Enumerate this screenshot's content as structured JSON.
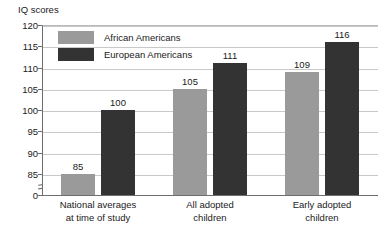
{
  "chart_data": {
    "type": "bar",
    "title": "",
    "ylabel": "IQ scores",
    "xlabel": "",
    "categories": [
      "National averages\nat time of study",
      "All adopted\nchildren",
      "Early adopted\nchildren"
    ],
    "category_lines": [
      [
        "National averages",
        "at time of study"
      ],
      [
        "All adopted",
        "children"
      ],
      [
        "Early adopted",
        "children"
      ]
    ],
    "series": [
      {
        "name": "African Americans",
        "values": [
          85,
          105,
          109
        ],
        "color": "#9a9a9a"
      },
      {
        "name": "European Americans",
        "values": [
          100,
          111,
          116
        ],
        "color": "#333333"
      }
    ],
    "ylim": [
      80,
      120
    ],
    "yticks": [
      0,
      85,
      90,
      95,
      100,
      105,
      110,
      115,
      120
    ],
    "ytick_labels": [
      "0",
      "85",
      "90",
      "95",
      "100",
      "105",
      "110",
      "115",
      "120"
    ],
    "grid": true,
    "grid_axis": "y",
    "axis_break": true,
    "axis_break_between": [
      0,
      85
    ],
    "legend_position": "upper-left-inside",
    "data_labels": [
      85,
      100,
      105,
      111,
      109,
      116
    ]
  },
  "legend": {
    "items": [
      {
        "label": "African Americans"
      },
      {
        "label": "European Americans"
      }
    ]
  }
}
